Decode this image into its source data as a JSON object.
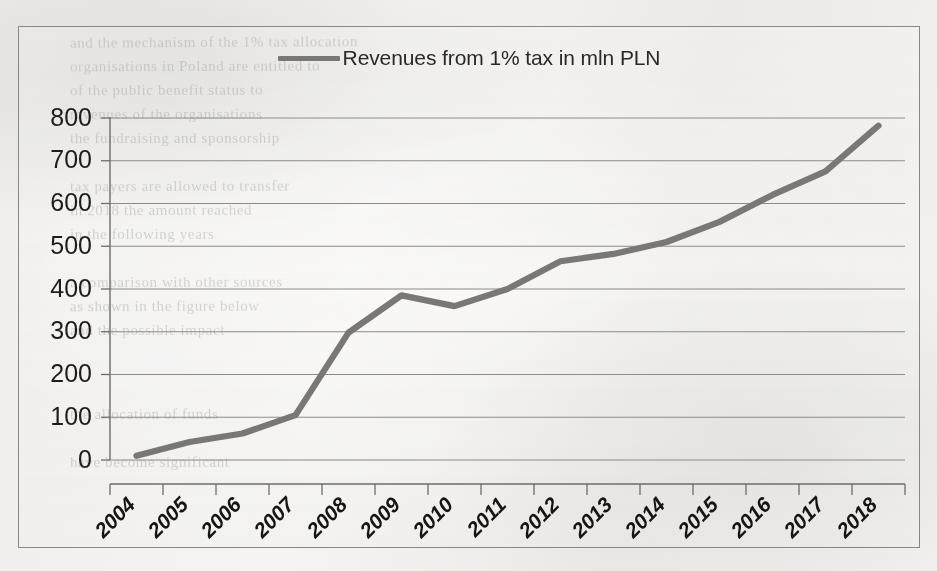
{
  "chart_data": {
    "type": "line",
    "title": "",
    "subtitle": "",
    "xlabel": "",
    "ylabel": "",
    "legend_position": "top-center",
    "grid": true,
    "ylim": [
      0,
      800
    ],
    "ytick_step": 100,
    "yticks": [
      "0",
      "100",
      "200",
      "300",
      "400",
      "500",
      "600",
      "700",
      "800"
    ],
    "categories": [
      "2004",
      "2005",
      "2006",
      "2007",
      "2008",
      "2009",
      "2010",
      "2011",
      "2012",
      "2013",
      "2014",
      "2015",
      "2016",
      "2017",
      "2018"
    ],
    "series": [
      {
        "name": "Revenues from 1% tax in mln PLN",
        "color": "#7a7875",
        "values": [
          10,
          42,
          62,
          105,
          298,
          385,
          360,
          400,
          465,
          482,
          510,
          557,
          620,
          675,
          782
        ]
      }
    ]
  },
  "legend": {
    "entries": [
      {
        "label": "Revenues from 1% tax in mln PLN",
        "swatch": "line-swatch",
        "color": "#7a7875"
      }
    ]
  },
  "axes": {
    "y": {
      "ticks": [
        "0",
        "100",
        "200",
        "300",
        "400",
        "500",
        "600",
        "700",
        "800"
      ]
    },
    "x": {
      "ticks": [
        "2004",
        "2005",
        "2006",
        "2007",
        "2008",
        "2009",
        "2010",
        "2011",
        "2012",
        "2013",
        "2014",
        "2015",
        "2016",
        "2017",
        "2018"
      ]
    }
  },
  "page_bleed_text": [
    {
      "text": "and the mechanism of the 1% tax allocation",
      "x": 70,
      "y": 34,
      "size": 15,
      "rot": -0.3
    },
    {
      "text": "organisations in Poland are entitled to",
      "x": 70,
      "y": 58,
      "size": 15,
      "rot": -0.2
    },
    {
      "text": "of the public benefit status to",
      "x": 70,
      "y": 82,
      "size": 15,
      "rot": -0.2
    },
    {
      "text": "revenues of the organisations",
      "x": 70,
      "y": 106,
      "size": 15,
      "rot": -0.1
    },
    {
      "text": "the fundraising and sponsorship",
      "x": 70,
      "y": 130,
      "size": 15,
      "rot": -0.1
    },
    {
      "text": "tax payers are allowed to transfer",
      "x": 70,
      "y": 178,
      "size": 15,
      "rot": -0.2
    },
    {
      "text": "in 2018 the amount reached",
      "x": 70,
      "y": 202,
      "size": 15,
      "rot": -0.2
    },
    {
      "text": "in the following years",
      "x": 70,
      "y": 226,
      "size": 15,
      "rot": -0.1
    },
    {
      "text": "a comparison with other sources",
      "x": 70,
      "y": 274,
      "size": 15,
      "rot": -0.2
    },
    {
      "text": "as shown in the figure below",
      "x": 70,
      "y": 298,
      "size": 15,
      "rot": -0.2
    },
    {
      "text": "and the possible impact",
      "x": 70,
      "y": 322,
      "size": 15,
      "rot": -0.1
    },
    {
      "text": "the allocation of funds",
      "x": 70,
      "y": 406,
      "size": 15,
      "rot": -0.1
    },
    {
      "text": "have become significant",
      "x": 70,
      "y": 454,
      "size": 15,
      "rot": -0.1
    }
  ]
}
